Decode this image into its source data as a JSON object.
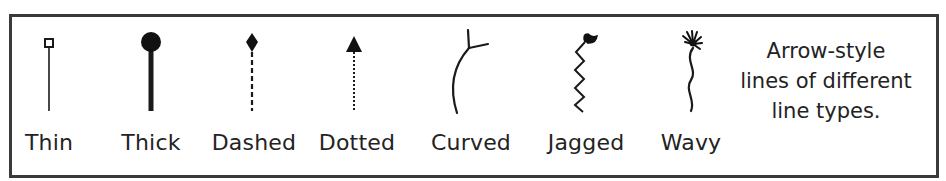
{
  "diagram": {
    "border_color": "#3a3a3a",
    "stroke_color": "#1a1a1a",
    "arrows": [
      {
        "label": "Thin",
        "line_type": "thin",
        "head": "hollow-square-icon",
        "x": 49
      },
      {
        "label": "Thick",
        "line_type": "thick",
        "head": "filled-circle-icon",
        "x": 151
      },
      {
        "label": "Dashed",
        "line_type": "dashed",
        "head": "filled-diamond-icon",
        "x": 252
      },
      {
        "label": "Dotted",
        "line_type": "dotted",
        "head": "filled-triangle-icon",
        "x": 354
      },
      {
        "label": "Curved",
        "line_type": "curved",
        "head": "open-fork-icon",
        "x": 471
      },
      {
        "label": "Jagged",
        "line_type": "jagged",
        "head": "open-hook-icon",
        "x": 584
      },
      {
        "label": "Wavy",
        "line_type": "wavy",
        "head": "burst-icon",
        "x": 690
      }
    ],
    "caption": {
      "line1": "Arrow-style",
      "line2": "lines of different",
      "line3": "line types."
    }
  }
}
